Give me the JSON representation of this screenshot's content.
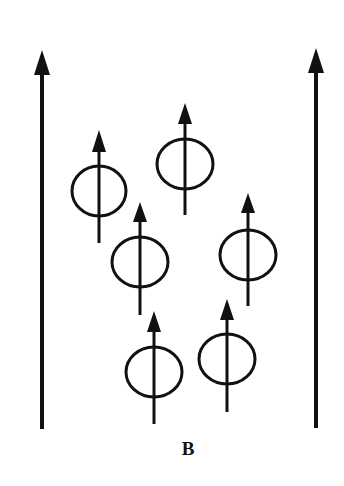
{
  "diagram": {
    "field_label": "B",
    "colors": {
      "stroke": "#111111",
      "background": "#ffffff"
    },
    "field_lines": [
      {
        "name": "left",
        "x": 42,
        "tip_y": 50,
        "head_base_y": 75,
        "bottom_y": 429,
        "direction": "up"
      },
      {
        "name": "right",
        "x": 316,
        "tip_y": 48,
        "head_base_y": 73,
        "bottom_y": 428,
        "direction": "up"
      }
    ],
    "dipoles": [
      {
        "id": 1,
        "cx": 99,
        "cy": 191,
        "rx": 27,
        "ry": 25,
        "tip_y": 130,
        "head_base_y": 152,
        "bottom_y": 243,
        "direction": "up"
      },
      {
        "id": 2,
        "cx": 185,
        "cy": 164,
        "rx": 28,
        "ry": 25,
        "tip_y": 103,
        "head_base_y": 124,
        "bottom_y": 215,
        "direction": "up"
      },
      {
        "id": 3,
        "cx": 140,
        "cy": 262,
        "rx": 28,
        "ry": 25,
        "tip_y": 202,
        "head_base_y": 222,
        "bottom_y": 315,
        "direction": "up"
      },
      {
        "id": 4,
        "cx": 248,
        "cy": 255,
        "rx": 28,
        "ry": 25,
        "tip_y": 193,
        "head_base_y": 213,
        "bottom_y": 306,
        "direction": "up"
      },
      {
        "id": 5,
        "cx": 154,
        "cy": 372,
        "rx": 28,
        "ry": 25,
        "tip_y": 311,
        "head_base_y": 332,
        "bottom_y": 424,
        "direction": "up"
      },
      {
        "id": 6,
        "cx": 227,
        "cy": 359,
        "rx": 28,
        "ry": 25,
        "tip_y": 299,
        "head_base_y": 320,
        "bottom_y": 412,
        "direction": "up"
      }
    ]
  }
}
